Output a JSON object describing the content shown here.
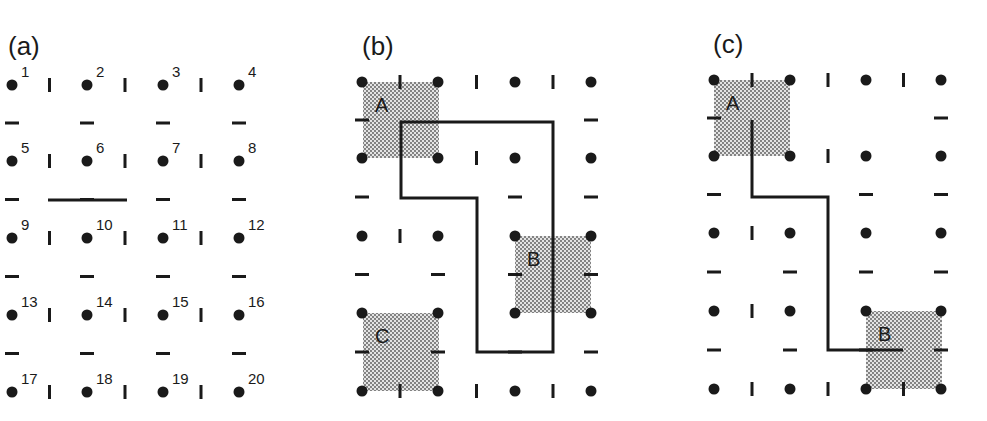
{
  "panels": [
    {
      "id": "a",
      "label": "(a)",
      "columns": [
        12,
        87,
        163,
        239
      ],
      "rows": [
        85,
        161,
        238,
        315,
        392
      ],
      "node_numbers": [
        "1",
        "2",
        "3",
        "4",
        "5",
        "6",
        "7",
        "8",
        "9",
        "10",
        "11",
        "12",
        "13",
        "14",
        "15",
        "16",
        "17",
        "18",
        "19",
        "20"
      ],
      "long_wall": {
        "x1": 48,
        "y1": 200,
        "x2": 127,
        "y2": 200
      }
    },
    {
      "id": "b",
      "label": "(b)",
      "columns": [
        362,
        438,
        515,
        591
      ],
      "rows": [
        82,
        158,
        236,
        313,
        391
      ],
      "regions": [
        {
          "name": "A",
          "x": 363,
          "y": 82,
          "w": 76,
          "h": 76
        },
        {
          "name": "B",
          "x": 515,
          "y": 236,
          "w": 76,
          "h": 77
        },
        {
          "name": "C",
          "x": 363,
          "y": 313,
          "w": 76,
          "h": 78
        }
      ],
      "path": "M401,122 L553,122 L553,352 L477,352 L477,198 L401,198 Z"
    },
    {
      "id": "c",
      "label": "(c)",
      "columns": [
        714,
        790,
        866,
        941
      ],
      "rows": [
        80,
        156,
        233,
        311,
        389
      ],
      "regions": [
        {
          "name": "A",
          "x": 714,
          "y": 80,
          "w": 76,
          "h": 76
        },
        {
          "name": "B",
          "x": 866,
          "y": 311,
          "w": 76,
          "h": 78
        }
      ],
      "path": "M752,120 L752,197 L828,197 L828,350 L903,350"
    }
  ],
  "colors": {
    "ink": "#1a1a1a",
    "shade": "#b8b8b8",
    "background": "#ffffff"
  }
}
